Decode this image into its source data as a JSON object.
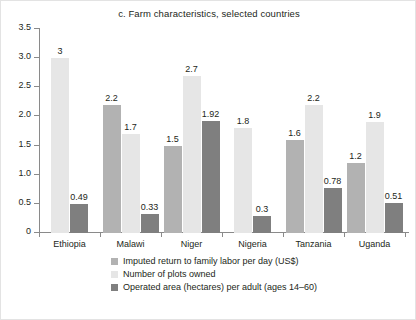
{
  "chart_data": {
    "type": "bar",
    "title": "c. Farm characteristics, selected countries",
    "xlabel": "",
    "ylabel": "",
    "ylim": [
      0,
      3.5
    ],
    "yticks": [
      "0",
      "0.5",
      "1.0",
      "1.5",
      "2.0",
      "2.5",
      "3.0",
      "3.5"
    ],
    "ytick_values": [
      0,
      0.5,
      1.0,
      1.5,
      2.0,
      2.5,
      3.0,
      3.5
    ],
    "grid": false,
    "legend_position": "bottom",
    "categories": [
      "Ethiopia",
      "Malawi",
      "Niger",
      "Nigeria",
      "Tanzania",
      "Uganda"
    ],
    "series": [
      {
        "name": "Imputed return to family labor per day (US$)",
        "color": "#b2b2b2",
        "values": [
          null,
          2.2,
          1.5,
          null,
          1.6,
          1.2
        ],
        "labels": [
          "",
          "2.2",
          "1.5",
          "",
          "1.6",
          "1.2"
        ]
      },
      {
        "name": "Number of plots owned",
        "color": "#e6e6e6",
        "values": [
          3,
          1.7,
          2.7,
          1.8,
          2.2,
          1.9
        ],
        "labels": [
          "3",
          "1.7",
          "2.7",
          "1.8",
          "2.2",
          "1.9"
        ]
      },
      {
        "name": "Operated area (hectares) per adult (ages 14–60)",
        "color": "#7f7f7f",
        "values": [
          0.49,
          0.33,
          1.92,
          0.3,
          0.78,
          0.51
        ],
        "labels": [
          "0.49",
          "0.33",
          "1.92",
          "0.3",
          "0.78",
          "0.51"
        ]
      }
    ]
  },
  "legend": {
    "items": [
      {
        "label": "Imputed return to family labor per day (US$)",
        "color": "#b2b2b2"
      },
      {
        "label": "Number of plots owned",
        "color": "#e6e6e6"
      },
      {
        "label": "Operated area (hectares) per adult (ages 14–60)",
        "color": "#7f7f7f"
      }
    ]
  }
}
